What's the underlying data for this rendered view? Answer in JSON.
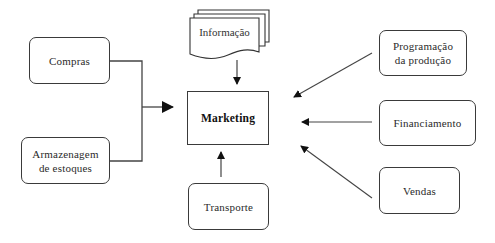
{
  "diagram": {
    "center": {
      "label": "Marketing"
    },
    "inputs_left": [
      {
        "id": "compras",
        "label": "Compras"
      },
      {
        "id": "armazenagem",
        "label": "Armazenagem\nde  estoques"
      }
    ],
    "input_top": {
      "id": "informacao",
      "label": "Informação",
      "shape": "multi-document"
    },
    "input_bottom": {
      "id": "transporte",
      "label": "Transporte"
    },
    "inputs_right": [
      {
        "id": "programacao",
        "label": "Programação\nda  produção"
      },
      {
        "id": "financiamento",
        "label": "Financiamento"
      },
      {
        "id": "vendas",
        "label": "Vendas"
      }
    ],
    "edges": [
      {
        "from": "compras",
        "to": "Marketing"
      },
      {
        "from": "armazenagem",
        "to": "Marketing"
      },
      {
        "from": "informacao",
        "to": "Marketing"
      },
      {
        "from": "transporte",
        "to": "Marketing"
      },
      {
        "from": "programacao",
        "to": "Marketing"
      },
      {
        "from": "financiamento",
        "to": "Marketing"
      },
      {
        "from": "vendas",
        "to": "Marketing"
      }
    ]
  }
}
